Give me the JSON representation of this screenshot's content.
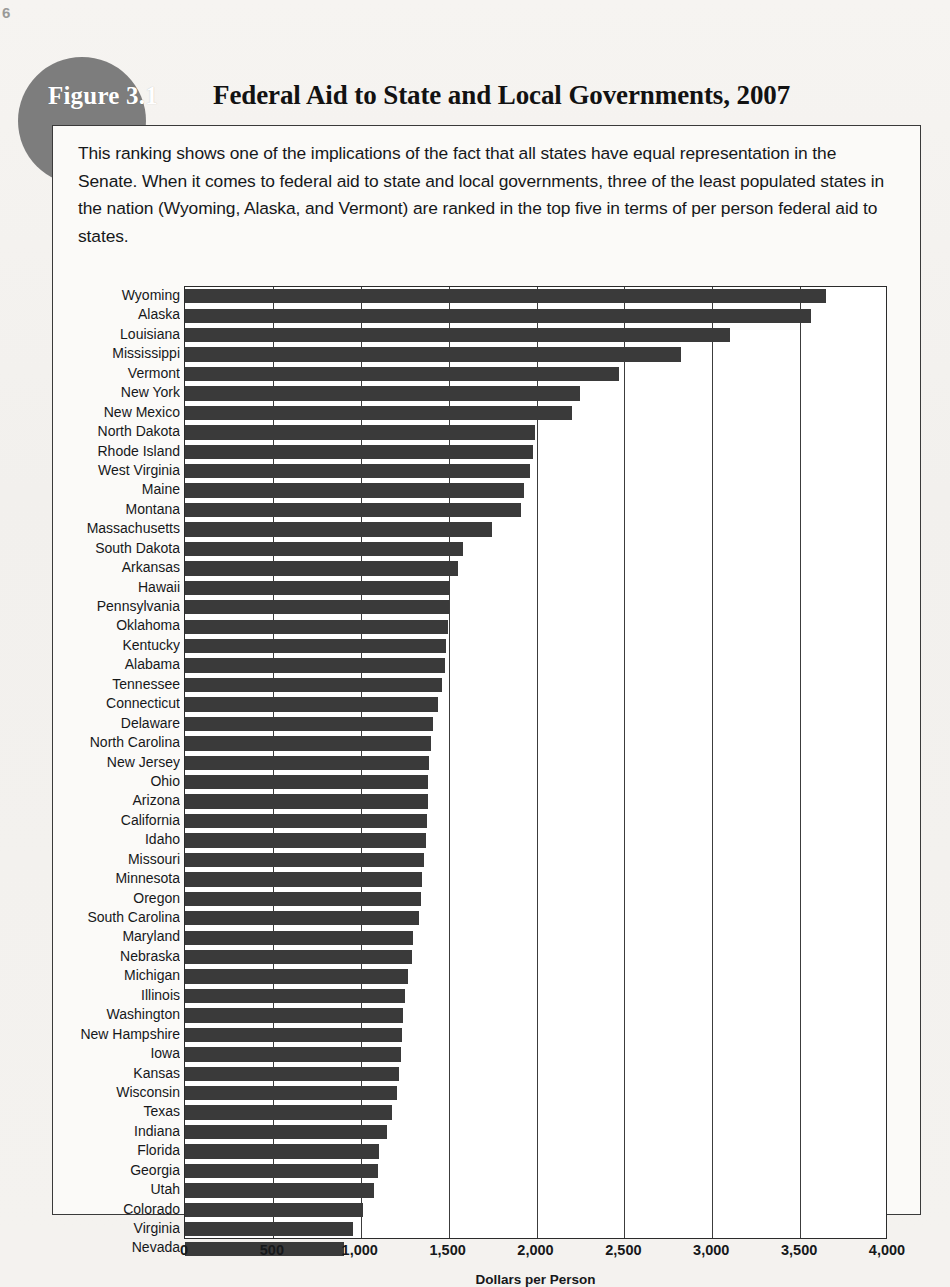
{
  "folio": "6",
  "figure": {
    "tag": "Figure 3.1",
    "title": "Federal Aid to State and Local Governments, 2007",
    "caption": "This ranking shows one of the implications of the fact that all states have equal representation in the Senate. When it comes to federal aid to state and local governments, three of the least populated states in the nation (Wyoming, Alaska, and Vermont) are ranked in the top five in terms of per person federal aid to states.",
    "tag_bg_color": "#7d7d7d",
    "bar_color": "#3a3a3a"
  },
  "chart_data": {
    "type": "bar",
    "orientation": "horizontal",
    "title": "Federal Aid to State and Local Governments, 2007",
    "xlabel": "Dollars per Person",
    "ylabel": "",
    "xlim": [
      0,
      4000
    ],
    "xticks": [
      0,
      500,
      1000,
      1500,
      2000,
      2500,
      3000,
      3500,
      4000
    ],
    "xticklabels": [
      "0",
      "500",
      "1,000",
      "1,500",
      "2,000",
      "2,500",
      "3,000",
      "3,500",
      "4,000"
    ],
    "grid": "vertical",
    "legend": "none",
    "categories": [
      "Wyoming",
      "Alaska",
      "Louisiana",
      "Mississippi",
      "Vermont",
      "New York",
      "New Mexico",
      "North Dakota",
      "Rhode Island",
      "West Virginia",
      "Maine",
      "Montana",
      "Massachusetts",
      "South Dakota",
      "Arkansas",
      "Hawaii",
      "Pennsylvania",
      "Oklahoma",
      "Kentucky",
      "Alabama",
      "Tennessee",
      "Connecticut",
      "Delaware",
      "North Carolina",
      "New Jersey",
      "Ohio",
      "Arizona",
      "California",
      "Idaho",
      "Missouri",
      "Minnesota",
      "Oregon",
      "South Carolina",
      "Maryland",
      "Nebraska",
      "Michigan",
      "Illinois",
      "Washington",
      "New Hampshire",
      "Iowa",
      "Kansas",
      "Wisconsin",
      "Texas",
      "Indiana",
      "Florida",
      "Georgia",
      "Utah",
      "Colorado",
      "Virginia",
      "Nevada"
    ],
    "values": [
      3650,
      3560,
      3100,
      2820,
      2470,
      2250,
      2200,
      1990,
      1980,
      1965,
      1930,
      1910,
      1745,
      1580,
      1555,
      1505,
      1500,
      1495,
      1485,
      1480,
      1465,
      1440,
      1410,
      1400,
      1390,
      1385,
      1380,
      1375,
      1370,
      1360,
      1350,
      1340,
      1330,
      1300,
      1290,
      1270,
      1250,
      1240,
      1235,
      1230,
      1220,
      1205,
      1175,
      1150,
      1105,
      1100,
      1075,
      1015,
      955,
      905
    ]
  }
}
